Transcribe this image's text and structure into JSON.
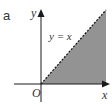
{
  "figure": {
    "panel_label": "a",
    "axis_x_label": "x",
    "axis_y_label": "y",
    "origin_label": "O",
    "line_label": "y = x",
    "line_style": "dashed",
    "shaded_region": "below line y = x, x ≥ 0, y ≥ 0",
    "colors": {
      "shade": "#939393",
      "axis": "#1a1a1a",
      "text": "#333333"
    }
  }
}
